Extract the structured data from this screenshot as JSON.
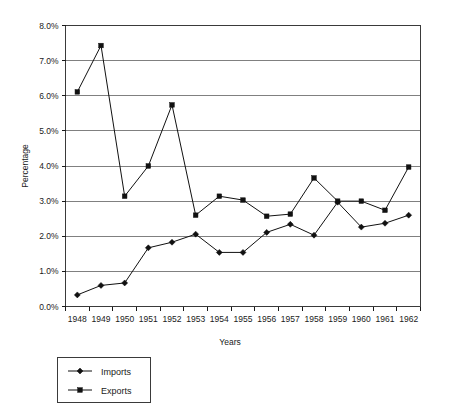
{
  "chart_data": {
    "type": "line",
    "title": "",
    "xlabel": "Years",
    "ylabel": "Percentage",
    "categories": [
      "1948",
      "1949",
      "1950",
      "1951",
      "1952",
      "1953",
      "1954",
      "1955",
      "1956",
      "1957",
      "1958",
      "1959",
      "1960",
      "1961",
      "1962"
    ],
    "ylim": [
      0.0,
      8.0
    ],
    "ytick_values": [
      0.0,
      1.0,
      2.0,
      3.0,
      4.0,
      5.0,
      6.0,
      7.0,
      8.0
    ],
    "ytick_labels": [
      "0.0%",
      "1.0%",
      "2.0%",
      "3.0%",
      "4.0%",
      "5.0%",
      "6.0%",
      "7.0%",
      "8.0%"
    ],
    "grid": true,
    "legend_position": "below-left",
    "series": [
      {
        "name": "Imports",
        "marker": "diamond",
        "color": "#111111",
        "values": [
          0.33,
          0.6,
          0.67,
          1.67,
          1.83,
          2.06,
          1.54,
          1.54,
          2.11,
          2.34,
          2.03,
          2.97,
          2.26,
          2.37,
          2.6
        ]
      },
      {
        "name": "Exports",
        "marker": "square",
        "color": "#111111",
        "values": [
          6.11,
          7.43,
          3.14,
          4.0,
          5.74,
          2.6,
          3.14,
          3.03,
          2.57,
          2.63,
          3.66,
          3.0,
          3.0,
          2.74,
          3.97
        ]
      }
    ]
  },
  "legend": {
    "items": [
      {
        "label": "Imports",
        "marker": "diamond"
      },
      {
        "label": "Exports",
        "marker": "square"
      }
    ]
  },
  "axes": {
    "y_title": "Percentage",
    "x_title": "Years"
  }
}
